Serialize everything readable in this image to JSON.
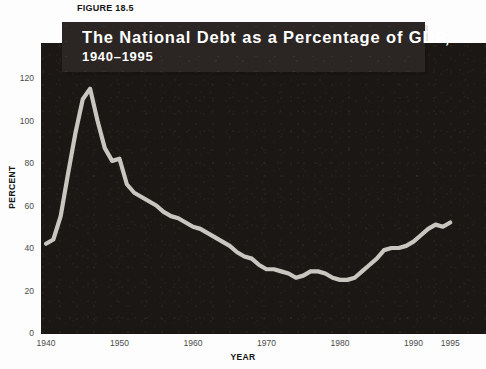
{
  "figure": {
    "label": "FIGURE 18.5",
    "title_line_1": "The National Debt as a Percentage of GDP,",
    "title_line_2": "1940–1995"
  },
  "colors": {
    "panel_background": "#1a1715",
    "banner_background": "#2b2623",
    "line": "#c9c6c0",
    "page_background": "#ffffff",
    "tick_text": "#4b4b4b",
    "axis_title_text": "#141414"
  },
  "chart_data": {
    "type": "line",
    "title": "The National Debt as a Percentage of GDP, 1940–1995",
    "xlabel": "YEAR",
    "ylabel": "PERCENT",
    "xlim": [
      1940,
      1995
    ],
    "ylim": [
      0,
      130
    ],
    "grid": false,
    "legend": "none",
    "x_ticks": [
      1940,
      1950,
      1960,
      1970,
      1980,
      1990,
      1995
    ],
    "x_tick_labels": [
      "1940",
      "1950",
      "1960",
      "1970",
      "1980",
      "1990",
      "1995"
    ],
    "y_ticks": [
      0,
      20,
      40,
      60,
      80,
      100,
      120
    ],
    "y_tick_labels": [
      "0",
      "20",
      "40",
      "60",
      "80",
      "100",
      "120"
    ],
    "series": [
      {
        "name": "National debt as percentage of GDP",
        "x": [
          1940,
          1941,
          1942,
          1943,
          1944,
          1945,
          1946,
          1947,
          1948,
          1949,
          1950,
          1951,
          1952,
          1953,
          1954,
          1955,
          1956,
          1957,
          1958,
          1959,
          1960,
          1961,
          1962,
          1963,
          1964,
          1965,
          1966,
          1967,
          1968,
          1969,
          1970,
          1971,
          1972,
          1973,
          1974,
          1975,
          1976,
          1977,
          1978,
          1979,
          1980,
          1981,
          1982,
          1983,
          1984,
          1985,
          1986,
          1987,
          1988,
          1989,
          1990,
          1991,
          1992,
          1993,
          1994,
          1995
        ],
        "values": [
          42,
          44,
          55,
          75,
          94,
          110,
          115,
          100,
          87,
          81,
          82,
          70,
          66,
          64,
          62,
          60,
          57,
          55,
          54,
          52,
          50,
          49,
          47,
          45,
          43,
          41,
          38,
          36,
          35,
          32,
          30,
          30,
          29,
          28,
          26,
          27,
          29,
          29,
          28,
          26,
          25,
          25,
          26,
          29,
          32,
          35,
          39,
          40,
          40,
          41,
          43,
          46,
          49,
          51,
          50,
          52
        ]
      }
    ]
  },
  "axes": {
    "y_title": "PERCENT",
    "x_title": "YEAR"
  }
}
